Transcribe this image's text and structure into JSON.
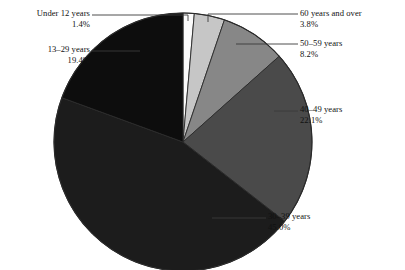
{
  "chart_data": {
    "type": "pie",
    "title": "",
    "subtitle": "",
    "xlabel": "",
    "ylabel": "",
    "legend_position": "callout-labels",
    "grid": false,
    "total_percent": 99.9,
    "start_angle_deg": 0,
    "direction": "clockwise",
    "categories": [
      "Under 12 years",
      "60 years and over",
      "50–59 years",
      "40–49 years",
      "30–39 years",
      "13–29 years"
    ],
    "values": [
      1.4,
      3.8,
      8.2,
      22.1,
      45.0,
      19.4
    ],
    "value_labels": [
      "1.4%",
      "3.8%",
      "8.2%",
      "22.1%",
      "45.0%",
      "19.4%"
    ],
    "colors": [
      "#fbfbfb",
      "#c6c6c6",
      "#878787",
      "#4a4a4a",
      "#1c1c1c",
      "#0d0d0d"
    ],
    "slices": [
      {
        "label": "Under 12 years",
        "value": 1.4,
        "value_label": "1.4%",
        "color": "#fbfbfb"
      },
      {
        "label": "60 years and over",
        "value": 3.8,
        "value_label": "3.8%",
        "color": "#c6c6c6"
      },
      {
        "label": "50–59 years",
        "value": 8.2,
        "value_label": "8.2%",
        "color": "#878787"
      },
      {
        "label": "40–49 years",
        "value": 22.1,
        "value_label": "22.1%",
        "color": "#4a4a4a"
      },
      {
        "label": "30–39 years",
        "value": 45.0,
        "value_label": "45.0%",
        "color": "#1c1c1c"
      },
      {
        "label": "13–29 years",
        "value": 19.4,
        "value_label": "19.4%",
        "color": "#0d0d0d"
      }
    ]
  },
  "callouts": {
    "under12": {
      "label": "Under 12 years",
      "percent": "1.4%"
    },
    "age13_29": {
      "label": "13–29 years",
      "percent": "19.4%"
    },
    "age60up": {
      "label": "60 years and over",
      "percent": "3.8%"
    },
    "age50_59": {
      "label": "50–59 years",
      "percent": "8.2%"
    },
    "age40_49": {
      "label": "40–49 years",
      "percent": "22.1%"
    },
    "age30_39": {
      "label": "30–39 years",
      "percent": "45.0%"
    }
  },
  "style": {
    "background": "#ffffff",
    "outline_color": "#2a2a2a",
    "leader_color": "#3a3a3a"
  }
}
